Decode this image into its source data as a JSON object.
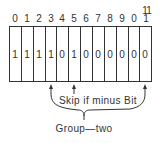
{
  "diagram": {
    "bit_positions": [
      {
        "top": "",
        "bottom": "0"
      },
      {
        "top": "",
        "bottom": "1"
      },
      {
        "top": "",
        "bottom": "2"
      },
      {
        "top": "",
        "bottom": "3"
      },
      {
        "top": "",
        "bottom": "4"
      },
      {
        "top": "",
        "bottom": "5"
      },
      {
        "top": "",
        "bottom": "6"
      },
      {
        "top": "",
        "bottom": "7"
      },
      {
        "top": "",
        "bottom": "8"
      },
      {
        "top": "",
        "bottom": "9"
      },
      {
        "top": "1",
        "bottom": "0"
      },
      {
        "top": "1",
        "bottom": "1"
      }
    ],
    "bit_values": [
      "1",
      "1",
      "1",
      "1",
      "0",
      "1",
      "0",
      "0",
      "0",
      "0",
      "0",
      "0"
    ],
    "annotation": "Skip if minus Bit",
    "group_label": "Group—two",
    "colors": {
      "line": "#333333",
      "background": "#ffffff"
    }
  }
}
